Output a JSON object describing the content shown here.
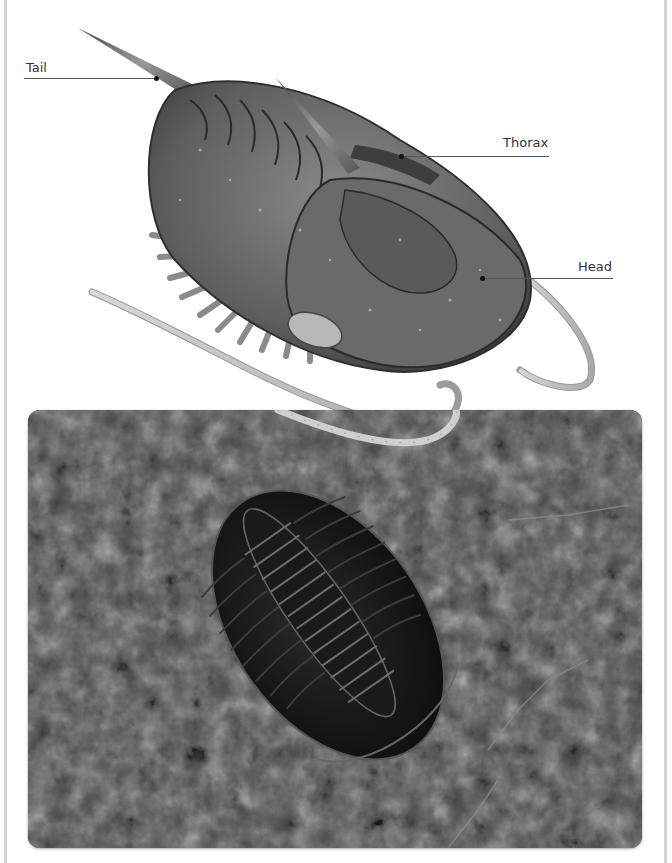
{
  "diagram": {
    "labels": [
      {
        "id": "tail",
        "text": "Tail"
      },
      {
        "id": "thorax",
        "text": "Thorax"
      },
      {
        "id": "head",
        "text": "Head"
      }
    ]
  },
  "photo": {
    "subject": "Trilobite fossil in rock"
  },
  "colors": {
    "frame": "#d4d4d4",
    "leader_line": "#555555",
    "label_text": "#333333"
  }
}
